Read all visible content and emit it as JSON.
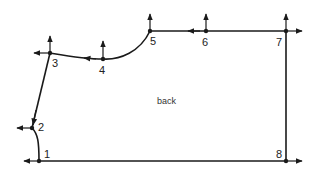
{
  "diagram": {
    "title_label": "back",
    "colors": {
      "line": "#1a1a1a",
      "text": "#222222",
      "background": "#ffffff"
    },
    "points": [
      {
        "id": "1",
        "label": "1",
        "x": 39,
        "y": 161
      },
      {
        "id": "2",
        "label": "2",
        "x": 32,
        "y": 128
      },
      {
        "id": "3",
        "label": "3",
        "x": 50,
        "y": 53
      },
      {
        "id": "4",
        "label": "4",
        "x": 103,
        "y": 59
      },
      {
        "id": "5",
        "label": "5",
        "x": 150,
        "y": 31
      },
      {
        "id": "6",
        "label": "6",
        "x": 206,
        "y": 31
      },
      {
        "id": "7",
        "label": "7",
        "x": 286,
        "y": 31
      },
      {
        "id": "8",
        "label": "8",
        "x": 286,
        "y": 161
      }
    ],
    "arrows": [
      {
        "at": "1",
        "direction": "left"
      },
      {
        "at": "2",
        "direction": "left"
      },
      {
        "at": "3",
        "direction": "left"
      },
      {
        "at": "3",
        "direction": "up"
      },
      {
        "at": "4",
        "direction": "up"
      },
      {
        "at": "4",
        "direction": "left"
      },
      {
        "at": "5",
        "direction": "up"
      },
      {
        "at": "6",
        "direction": "up"
      },
      {
        "at": "6",
        "direction": "left"
      },
      {
        "at": "7",
        "direction": "up"
      },
      {
        "at": "7",
        "direction": "right"
      },
      {
        "at": "8",
        "direction": "right"
      }
    ]
  }
}
